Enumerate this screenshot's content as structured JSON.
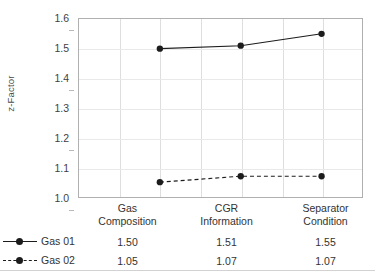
{
  "chart_data": {
    "type": "line",
    "title": "",
    "xlabel": "",
    "ylabel": "z-Factor",
    "ylim": [
      1.0,
      1.6
    ],
    "ytick_step": 0.1,
    "yticks": [
      "1.6",
      "1.5",
      "1.4",
      "1.3",
      "1.2",
      "1.1",
      "1.0"
    ],
    "categories": [
      "Gas Composition",
      "CGR Information",
      "Separator Condition"
    ],
    "categories_wrapped": [
      [
        "Gas",
        "Composition"
      ],
      [
        "CGR",
        "Information"
      ],
      [
        "Separator",
        "Condition"
      ]
    ],
    "grid": true,
    "legend_position": "bottom-table",
    "series": [
      {
        "name": "Gas 01",
        "values": [
          1.5,
          1.51,
          1.55
        ],
        "labels": [
          "1.50",
          "1.51",
          "1.55"
        ],
        "line_style": "solid",
        "marker": "circle",
        "color": "#1c1c1c"
      },
      {
        "name": "Gas 02",
        "values": [
          1.05,
          1.07,
          1.07
        ],
        "labels": [
          "1.05",
          "1.07",
          "1.07"
        ],
        "line_style": "dashed",
        "marker": "circle",
        "color": "#1c1c1c"
      }
    ]
  },
  "colors": {
    "series": "#1c1c1c",
    "plot_border": "#b0b0b0",
    "gridline": "#e4e4e4",
    "table_border": "#d2d2d2",
    "background": "#ffffff"
  }
}
